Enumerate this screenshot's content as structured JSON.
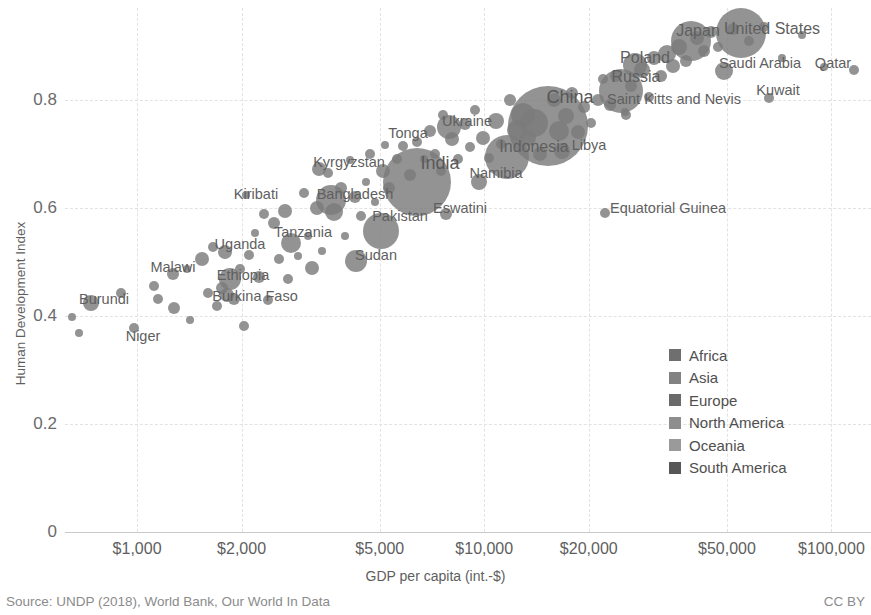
{
  "chart_data": {
    "type": "scatter",
    "title": "",
    "xlabel": "GDP per capita (int.-$)",
    "ylabel": "Human Development Index",
    "xscale": "log",
    "xlim": [
      620,
      130000
    ],
    "ylim": [
      0,
      0.97
    ],
    "grid": true,
    "xticks": [
      {
        "value": 1000,
        "label": "$1,000"
      },
      {
        "value": 2000,
        "label": "$2,000"
      },
      {
        "value": 5000,
        "label": "$5,000"
      },
      {
        "value": 10000,
        "label": "$10,000"
      },
      {
        "value": 20000,
        "label": "$20,000"
      },
      {
        "value": 50000,
        "label": "$50,000"
      },
      {
        "value": 100000,
        "label": "$100,000"
      }
    ],
    "yticks": [
      {
        "value": 0,
        "label": "0"
      },
      {
        "value": 0.2,
        "label": "0.2"
      },
      {
        "value": 0.4,
        "label": "0.4"
      },
      {
        "value": 0.6,
        "label": "0.6"
      },
      {
        "value": 0.8,
        "label": "0.8"
      }
    ],
    "legend": {
      "position": "inside-right",
      "entries": [
        {
          "name": "Africa",
          "color": "#6f6f6f"
        },
        {
          "name": "Asia",
          "color": "#828282"
        },
        {
          "name": "Europe",
          "color": "#6a6a6a"
        },
        {
          "name": "North America",
          "color": "#8e8e8e"
        },
        {
          "name": "Oceania",
          "color": "#9a9a9a"
        },
        {
          "name": "South America",
          "color": "#575757"
        }
      ]
    },
    "bubble_color": "#7b7b7b",
    "bubble_opacity": 0.82,
    "bubble_encoding": "population",
    "labeled_points": [
      {
        "name": "Burundi",
        "x": 736,
        "y": 0.423,
        "r": 8,
        "lx": 104,
        "ly": 299
      },
      {
        "name": "Niger",
        "x": 980,
        "y": 0.377,
        "r": 5,
        "lx": 143,
        "ly": 336
      },
      {
        "name": "Malawi",
        "x": 1270,
        "y": 0.478,
        "r": 6,
        "lx": 173,
        "ly": 267
      },
      {
        "name": "Uganda",
        "x": 1790,
        "y": 0.518,
        "r": 7,
        "lx": 240,
        "ly": 244
      },
      {
        "name": "Ethiopia",
        "x": 1855,
        "y": 0.468,
        "r": 11,
        "lx": 243,
        "ly": 275
      },
      {
        "name": "Burkina Faso",
        "x": 1810,
        "y": 0.438,
        "r": 7,
        "lx": 255,
        "ly": 296
      },
      {
        "name": "Tanzania",
        "x": 2780,
        "y": 0.535,
        "r": 10,
        "lx": 303,
        "ly": 232
      },
      {
        "name": "Kiribati",
        "x": 2060,
        "y": 0.623,
        "r": 4,
        "lx": 256,
        "ly": 194
      },
      {
        "name": "Bangladesh",
        "x": 3610,
        "y": 0.614,
        "r": 15,
        "lx": 355,
        "ly": 194
      },
      {
        "name": "Kyrgyzstan",
        "x": 3350,
        "y": 0.672,
        "r": 7,
        "lx": 349,
        "ly": 162
      },
      {
        "name": "Sudan",
        "x": 4280,
        "y": 0.502,
        "r": 11,
        "lx": 376,
        "ly": 255
      },
      {
        "name": "Pakistan",
        "x": 5030,
        "y": 0.558,
        "r": 18,
        "lx": 400,
        "ly": 216
      },
      {
        "name": "India",
        "x": 6420,
        "y": 0.647,
        "r": 34,
        "lx": 440,
        "ly": 163
      },
      {
        "name": "Tonga",
        "x": 5190,
        "y": 0.717,
        "r": 4,
        "lx": 408,
        "ly": 133
      },
      {
        "name": "Eswatini",
        "x": 7740,
        "y": 0.588,
        "r": 6,
        "lx": 460,
        "ly": 208
      },
      {
        "name": "Ukraine",
        "x": 7900,
        "y": 0.75,
        "r": 12,
        "lx": 467,
        "ly": 121
      },
      {
        "name": "Namibia",
        "x": 9640,
        "y": 0.647,
        "r": 8,
        "lx": 496,
        "ly": 173
      },
      {
        "name": "Indonesia",
        "x": 11600,
        "y": 0.694,
        "r": 22,
        "lx": 534,
        "ly": 147
      },
      {
        "name": "China",
        "x": 15300,
        "y": 0.752,
        "r": 40,
        "lx": 570,
        "ly": 97
      },
      {
        "name": "Libya",
        "x": 16800,
        "y": 0.706,
        "r": 8,
        "lx": 589,
        "ly": 145
      },
      {
        "name": "Russia",
        "x": 24800,
        "y": 0.816,
        "r": 22,
        "lx": 636,
        "ly": 77
      },
      {
        "name": "Poland",
        "x": 27200,
        "y": 0.865,
        "r": 12,
        "lx": 645,
        "ly": 58
      },
      {
        "name": "Saint Kitts and Nevis",
        "x": 25500,
        "y": 0.778,
        "r": 4,
        "lx": 674,
        "ly": 99
      },
      {
        "name": "Japan",
        "x": 39300,
        "y": 0.909,
        "r": 20,
        "lx": 698,
        "ly": 31
      },
      {
        "name": "United States",
        "x": 54800,
        "y": 0.924,
        "r": 25,
        "lx": 772,
        "ly": 29
      },
      {
        "name": "Saudi Arabia",
        "x": 49000,
        "y": 0.853,
        "r": 9,
        "lx": 760,
        "ly": 63
      },
      {
        "name": "Kuwait",
        "x": 66000,
        "y": 0.803,
        "r": 5,
        "lx": 778,
        "ly": 90
      },
      {
        "name": "Qatar",
        "x": 116000,
        "y": 0.856,
        "r": 5,
        "lx": 833,
        "ly": 63
      },
      {
        "name": "Equatorial Guinea",
        "x": 22300,
        "y": 0.591,
        "r": 5,
        "lx": 668,
        "ly": 208
      }
    ],
    "unlabeled_points": [
      {
        "x": 650,
        "y": 0.398,
        "r": 4
      },
      {
        "x": 680,
        "y": 0.368,
        "r": 4
      },
      {
        "x": 900,
        "y": 0.442,
        "r": 5
      },
      {
        "x": 1120,
        "y": 0.455,
        "r": 5
      },
      {
        "x": 1150,
        "y": 0.432,
        "r": 5
      },
      {
        "x": 1280,
        "y": 0.415,
        "r": 6
      },
      {
        "x": 1390,
        "y": 0.487,
        "r": 4
      },
      {
        "x": 1420,
        "y": 0.392,
        "r": 4
      },
      {
        "x": 1540,
        "y": 0.505,
        "r": 7
      },
      {
        "x": 1600,
        "y": 0.443,
        "r": 5
      },
      {
        "x": 1660,
        "y": 0.528,
        "r": 5
      },
      {
        "x": 1700,
        "y": 0.418,
        "r": 5
      },
      {
        "x": 1760,
        "y": 0.452,
        "r": 6
      },
      {
        "x": 1900,
        "y": 0.432,
        "r": 6
      },
      {
        "x": 1980,
        "y": 0.487,
        "r": 5
      },
      {
        "x": 2030,
        "y": 0.382,
        "r": 5
      },
      {
        "x": 2100,
        "y": 0.512,
        "r": 5
      },
      {
        "x": 2180,
        "y": 0.553,
        "r": 4
      },
      {
        "x": 2250,
        "y": 0.472,
        "r": 6
      },
      {
        "x": 2320,
        "y": 0.588,
        "r": 5
      },
      {
        "x": 2390,
        "y": 0.43,
        "r": 5
      },
      {
        "x": 2480,
        "y": 0.572,
        "r": 6
      },
      {
        "x": 2560,
        "y": 0.505,
        "r": 5
      },
      {
        "x": 2660,
        "y": 0.594,
        "r": 7
      },
      {
        "x": 2720,
        "y": 0.468,
        "r": 5
      },
      {
        "x": 2900,
        "y": 0.51,
        "r": 4
      },
      {
        "x": 3020,
        "y": 0.628,
        "r": 5
      },
      {
        "x": 3100,
        "y": 0.548,
        "r": 4
      },
      {
        "x": 3180,
        "y": 0.488,
        "r": 7
      },
      {
        "x": 3290,
        "y": 0.6,
        "r": 7
      },
      {
        "x": 3420,
        "y": 0.52,
        "r": 4
      },
      {
        "x": 3550,
        "y": 0.665,
        "r": 5
      },
      {
        "x": 3700,
        "y": 0.592,
        "r": 9
      },
      {
        "x": 3870,
        "y": 0.636,
        "r": 6
      },
      {
        "x": 3980,
        "y": 0.548,
        "r": 4
      },
      {
        "x": 4100,
        "y": 0.688,
        "r": 4
      },
      {
        "x": 4250,
        "y": 0.62,
        "r": 6
      },
      {
        "x": 4420,
        "y": 0.585,
        "r": 5
      },
      {
        "x": 4550,
        "y": 0.648,
        "r": 4
      },
      {
        "x": 4700,
        "y": 0.7,
        "r": 5
      },
      {
        "x": 4850,
        "y": 0.61,
        "r": 4
      },
      {
        "x": 5100,
        "y": 0.668,
        "r": 7
      },
      {
        "x": 5320,
        "y": 0.636,
        "r": 6
      },
      {
        "x": 5600,
        "y": 0.69,
        "r": 5
      },
      {
        "x": 5850,
        "y": 0.714,
        "r": 5
      },
      {
        "x": 6100,
        "y": 0.66,
        "r": 6
      },
      {
        "x": 6400,
        "y": 0.722,
        "r": 5
      },
      {
        "x": 6700,
        "y": 0.69,
        "r": 4
      },
      {
        "x": 7000,
        "y": 0.742,
        "r": 6
      },
      {
        "x": 7200,
        "y": 0.7,
        "r": 5
      },
      {
        "x": 7500,
        "y": 0.668,
        "r": 5
      },
      {
        "x": 7600,
        "y": 0.772,
        "r": 5
      },
      {
        "x": 8100,
        "y": 0.728,
        "r": 7
      },
      {
        "x": 8400,
        "y": 0.69,
        "r": 5
      },
      {
        "x": 8800,
        "y": 0.755,
        "r": 6
      },
      {
        "x": 9100,
        "y": 0.712,
        "r": 5
      },
      {
        "x": 9400,
        "y": 0.782,
        "r": 5
      },
      {
        "x": 9900,
        "y": 0.73,
        "r": 7
      },
      {
        "x": 10300,
        "y": 0.692,
        "r": 5
      },
      {
        "x": 10800,
        "y": 0.76,
        "r": 8
      },
      {
        "x": 11200,
        "y": 0.718,
        "r": 5
      },
      {
        "x": 11900,
        "y": 0.8,
        "r": 6
      },
      {
        "x": 12400,
        "y": 0.745,
        "r": 10
      },
      {
        "x": 12900,
        "y": 0.772,
        "r": 12
      },
      {
        "x": 13400,
        "y": 0.73,
        "r": 8
      },
      {
        "x": 13900,
        "y": 0.758,
        "r": 14
      },
      {
        "x": 14500,
        "y": 0.7,
        "r": 7
      },
      {
        "x": 15900,
        "y": 0.8,
        "r": 7
      },
      {
        "x": 16400,
        "y": 0.742,
        "r": 10
      },
      {
        "x": 17200,
        "y": 0.77,
        "r": 8
      },
      {
        "x": 17900,
        "y": 0.812,
        "r": 6
      },
      {
        "x": 18600,
        "y": 0.74,
        "r": 7
      },
      {
        "x": 19400,
        "y": 0.786,
        "r": 6
      },
      {
        "x": 20300,
        "y": 0.758,
        "r": 5
      },
      {
        "x": 21200,
        "y": 0.8,
        "r": 6
      },
      {
        "x": 22000,
        "y": 0.838,
        "r": 5
      },
      {
        "x": 23000,
        "y": 0.79,
        "r": 6
      },
      {
        "x": 24000,
        "y": 0.845,
        "r": 6
      },
      {
        "x": 25600,
        "y": 0.772,
        "r": 5
      },
      {
        "x": 26500,
        "y": 0.826,
        "r": 6
      },
      {
        "x": 28500,
        "y": 0.855,
        "r": 8
      },
      {
        "x": 29800,
        "y": 0.806,
        "r": 5
      },
      {
        "x": 30900,
        "y": 0.878,
        "r": 7
      },
      {
        "x": 32200,
        "y": 0.845,
        "r": 6
      },
      {
        "x": 33500,
        "y": 0.885,
        "r": 9
      },
      {
        "x": 35000,
        "y": 0.862,
        "r": 7
      },
      {
        "x": 36500,
        "y": 0.898,
        "r": 8
      },
      {
        "x": 38000,
        "y": 0.872,
        "r": 6
      },
      {
        "x": 41000,
        "y": 0.915,
        "r": 7
      },
      {
        "x": 43000,
        "y": 0.89,
        "r": 6
      },
      {
        "x": 45000,
        "y": 0.925,
        "r": 6
      },
      {
        "x": 47000,
        "y": 0.898,
        "r": 5
      },
      {
        "x": 52000,
        "y": 0.932,
        "r": 6
      },
      {
        "x": 58000,
        "y": 0.908,
        "r": 5
      },
      {
        "x": 64000,
        "y": 0.935,
        "r": 5
      },
      {
        "x": 72000,
        "y": 0.878,
        "r": 4
      },
      {
        "x": 82000,
        "y": 0.92,
        "r": 4
      },
      {
        "x": 95000,
        "y": 0.86,
        "r": 4
      }
    ]
  },
  "footer": {
    "source": "Source: UNDP (2018), World Bank, Our World In Data",
    "license": "CC BY"
  }
}
